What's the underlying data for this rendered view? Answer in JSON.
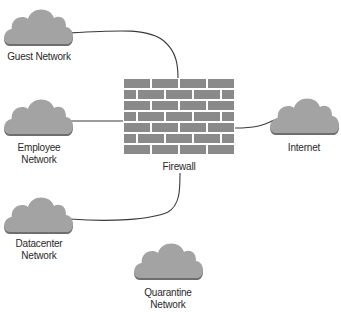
{
  "diagram": {
    "type": "network-topology",
    "nodes": [
      {
        "id": "guest",
        "label": "Guest Network",
        "kind": "cloud"
      },
      {
        "id": "employee",
        "label": "Employee\nNetwork",
        "kind": "cloud"
      },
      {
        "id": "datacenter",
        "label": "Datacenter\nNetwork",
        "kind": "cloud"
      },
      {
        "id": "quarantine",
        "label": "Quarantine\nNetwork",
        "kind": "cloud"
      },
      {
        "id": "firewall",
        "label": "Firewall",
        "kind": "firewall"
      },
      {
        "id": "internet",
        "label": "Internet",
        "kind": "cloud"
      }
    ],
    "edges": [
      {
        "from": "guest",
        "to": "firewall"
      },
      {
        "from": "employee",
        "to": "firewall"
      },
      {
        "from": "datacenter",
        "to": "firewall"
      },
      {
        "from": "firewall",
        "to": "internet"
      }
    ],
    "colors": {
      "cloud_fill": "#a3a3a3",
      "cloud_shadow": "#6e6e6e",
      "brick": "#8a8a8a",
      "mortar": "#ffffff",
      "line": "#3a3a3a",
      "text": "#2a2a2a"
    }
  }
}
